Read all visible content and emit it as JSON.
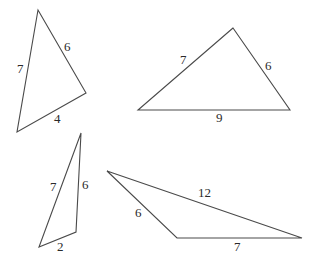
{
  "diagram": {
    "stroke_color": "#4a4a4a",
    "label_color": "#2a2a2a",
    "triangles": [
      {
        "id": "triangle-1",
        "sides": [
          7,
          6,
          4
        ],
        "vertices": [
          [
            38,
            10
          ],
          [
            86,
            93
          ],
          [
            17,
            132
          ]
        ],
        "labels": [
          {
            "text": "7",
            "x": 17,
            "y": 73
          },
          {
            "text": "6",
            "x": 64,
            "y": 51
          },
          {
            "text": "4",
            "x": 54,
            "y": 123
          }
        ]
      },
      {
        "id": "triangle-2",
        "sides": [
          7,
          6,
          9
        ],
        "vertices": [
          [
            233,
            28
          ],
          [
            138,
            110
          ],
          [
            290,
            110
          ]
        ],
        "labels": [
          {
            "text": "7",
            "x": 180,
            "y": 64
          },
          {
            "text": "6",
            "x": 265,
            "y": 70
          },
          {
            "text": "9",
            "x": 216,
            "y": 122
          }
        ]
      },
      {
        "id": "triangle-3",
        "sides": [
          7,
          6,
          2
        ],
        "vertices": [
          [
            81,
            133
          ],
          [
            76,
            232
          ],
          [
            39,
            247
          ]
        ],
        "labels": [
          {
            "text": "7",
            "x": 50,
            "y": 191
          },
          {
            "text": "6",
            "x": 82,
            "y": 189
          },
          {
            "text": "2",
            "x": 57,
            "y": 251
          }
        ]
      },
      {
        "id": "triangle-4",
        "sides": [
          12,
          6,
          7
        ],
        "vertices": [
          [
            107,
            171
          ],
          [
            177,
            238
          ],
          [
            302,
            238
          ]
        ],
        "labels": [
          {
            "text": "12",
            "x": 198,
            "y": 197
          },
          {
            "text": "6",
            "x": 135,
            "y": 217
          },
          {
            "text": "7",
            "x": 234,
            "y": 251
          }
        ]
      }
    ]
  }
}
